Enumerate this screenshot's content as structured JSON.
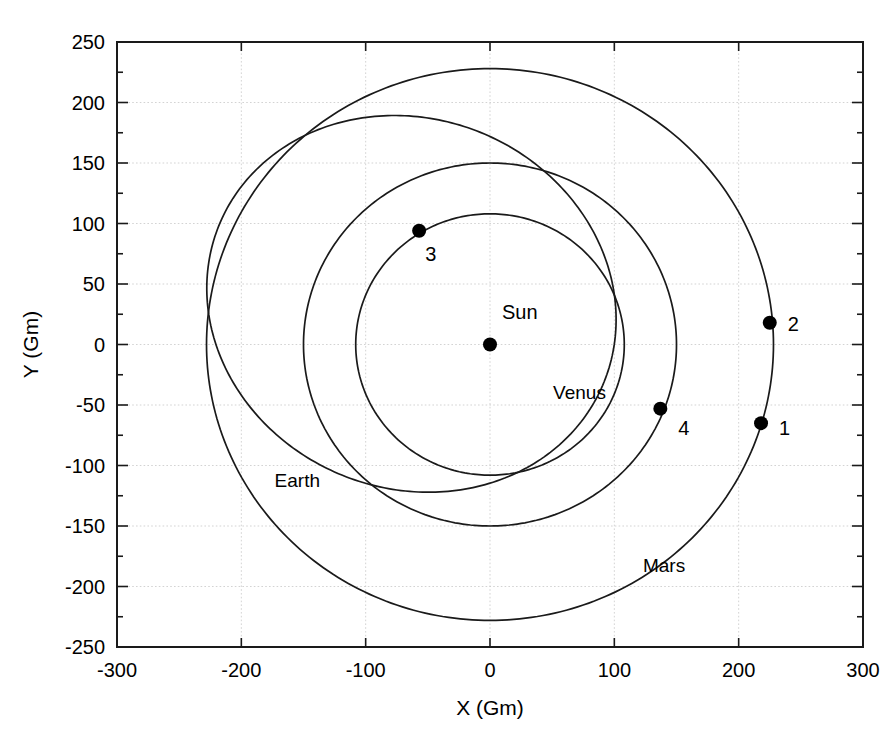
{
  "chart_data": {
    "type": "line",
    "title": "",
    "xlabel": "X (Gm)",
    "ylabel": "Y (Gm)",
    "xlim": [
      -300,
      300
    ],
    "ylim": [
      -250,
      250
    ],
    "xticks": [
      -300,
      -200,
      -100,
      0,
      100,
      200,
      300
    ],
    "yticks": [
      -250,
      -200,
      -150,
      -100,
      -50,
      0,
      50,
      100,
      150,
      200,
      250
    ],
    "xtick_labels": [
      "-300",
      "-200",
      "-100",
      "0",
      "100",
      "200",
      "300"
    ],
    "ytick_labels": [
      "-250",
      "-200",
      "-150",
      "-100",
      "-50",
      "0",
      "50",
      "100",
      "150",
      "200",
      "250"
    ],
    "grid": true,
    "legend": "none",
    "units": "Gm",
    "series": [
      {
        "name": "Venus",
        "kind": "circular-orbit",
        "center": [
          0,
          0
        ],
        "radius": 108,
        "label": "Venus",
        "label_position": [
          72,
          -45
        ]
      },
      {
        "name": "Earth",
        "kind": "circular-orbit",
        "center": [
          0,
          0
        ],
        "radius": 150,
        "label": "Earth",
        "label_position": [
          -155,
          -118
        ]
      },
      {
        "name": "Mars",
        "kind": "circular-orbit",
        "center": [
          0,
          0
        ],
        "radius": 228,
        "label": "Mars",
        "label_position": [
          140,
          -188
        ]
      },
      {
        "name": "Transfer trajectory",
        "kind": "ellipse",
        "semi_major": 168,
        "semi_minor": 152,
        "focus": [
          0,
          0
        ],
        "rotation_deg": -28,
        "label": "",
        "label_position": [
          0,
          0
        ]
      }
    ],
    "annotations": [
      {
        "label": "Sun",
        "x": 0,
        "y": 0,
        "marker": true,
        "label_dx": 12,
        "label_dy": -26
      },
      {
        "label": "1",
        "x": 218,
        "y": -65,
        "marker": true,
        "label_dx": 18,
        "label_dy": 12
      },
      {
        "label": "2",
        "x": 225,
        "y": 18,
        "marker": true,
        "label_dx": 18,
        "label_dy": 8
      },
      {
        "label": "3",
        "x": -57,
        "y": 94,
        "marker": true,
        "label_dx": 6,
        "label_dy": 30
      },
      {
        "label": "4",
        "x": 137,
        "y": -53,
        "marker": true,
        "label_dx": 18,
        "label_dy": 26
      }
    ],
    "colors": {
      "curve": "#1a1a1a",
      "grid": "#c8c8c8",
      "axis": "#1a1a1a",
      "marker": "#000000",
      "background": "#ffffff"
    }
  }
}
